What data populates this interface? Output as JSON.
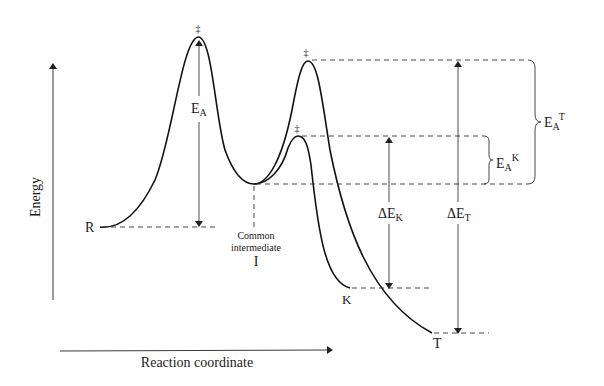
{
  "diagram": {
    "type": "reaction-energy-profile",
    "axes": {
      "y_label": "Energy",
      "x_label": "Reaction coordinate"
    },
    "species": {
      "reactant": "R",
      "intermediate_line1": "Common",
      "intermediate_line2": "intermediate",
      "intermediate_symbol": "I",
      "kinetic_product": "K",
      "thermodynamic_product": "T"
    },
    "transition_state_symbol": "‡",
    "energy_labels": {
      "ea": {
        "main": "E",
        "sub": "A"
      },
      "delta_ek": {
        "main": "ΔE",
        "sub": "K"
      },
      "delta_et": {
        "main": "ΔE",
        "sub": "T"
      },
      "ea_k": {
        "main": "E",
        "sub": "A",
        "sup": "K"
      },
      "ea_t": {
        "main": "E",
        "sub": "A",
        "sup": "T"
      }
    },
    "colors": {
      "line": "#111111",
      "background": "#ffffff"
    }
  }
}
